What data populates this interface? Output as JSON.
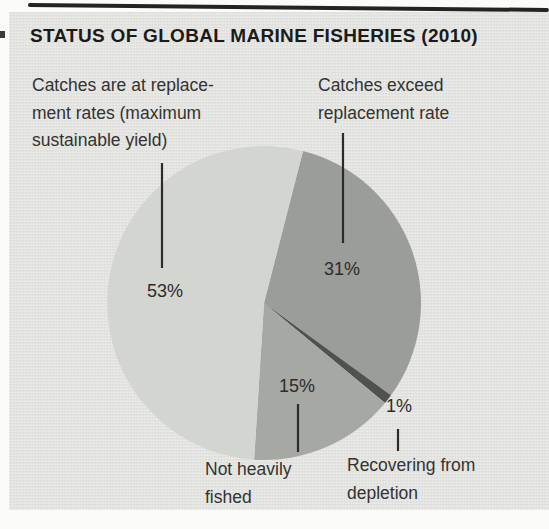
{
  "chart_data": {
    "type": "pie",
    "title": "STATUS OF GLOBAL MARINE FISHERIES (2010)",
    "start_angle_deg": 14.4,
    "direction": "clockwise",
    "legend_position": "none",
    "slices": [
      {
        "id": "exceed",
        "label": "Catches exceed replacement rate",
        "value": 31,
        "pct_label": "31%",
        "color": "#9b9d99"
      },
      {
        "id": "recovering",
        "label": "Recovering from depletion",
        "value": 1,
        "pct_label": "1%",
        "color": "#50524e"
      },
      {
        "id": "not-heavily-fished",
        "label": "Not heavily fished",
        "value": 15,
        "pct_label": "15%",
        "color": "#a6a8a4"
      },
      {
        "id": "msy",
        "label": "Catches are at replacement rates (maximum sustainable yield)",
        "value": 53,
        "pct_label": "53%",
        "color": "#d3d5d1"
      }
    ],
    "colors": {
      "panel_bg": "#e3e4e0",
      "title_text": "#1b1b19",
      "body_text": "#333331",
      "leader_line": "#2b2b29"
    }
  },
  "callouts": {
    "msy": {
      "line1": "Catches are at replace-",
      "line2": "ment rates (maximum",
      "line3": "sustainable yield)"
    },
    "exceed": {
      "line1": "Catches exceed",
      "line2": "replacement rate"
    },
    "not_heavily": {
      "line1": "Not heavily",
      "line2": "fished"
    },
    "recovering": {
      "line1": "Recovering from",
      "line2": "depletion"
    }
  }
}
